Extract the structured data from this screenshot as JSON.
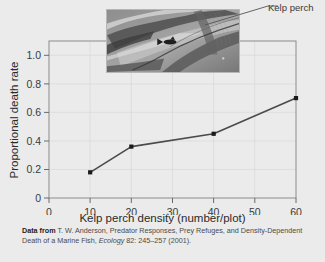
{
  "figure": {
    "top_clipped_text": "",
    "background_color": "#ebebeb"
  },
  "photo": {
    "name": "kelp-photo",
    "description": "Underwater grayscale photograph of kelp blades with a kelp perch fish"
  },
  "callout": {
    "label": "Kelp perch"
  },
  "source": {
    "lead": "Data from",
    "line1": " T. W. Anderson, Predator Responses, Prey Refuges, and Density-Dependent",
    "line2_a": "Death  of a Marine Fish, ",
    "journal": "Ecology",
    "line2_b": " 82: 245–257 (2001)."
  },
  "chart_data": {
    "type": "line",
    "title": "",
    "xlabel": "Kelp perch density (number/plot)",
    "ylabel": "Proportional death rate",
    "x": [
      10,
      20,
      40,
      60
    ],
    "values": [
      0.18,
      0.36,
      0.45,
      0.7
    ],
    "series": [
      {
        "name": "Proportional death rate",
        "values": [
          0.18,
          0.36,
          0.45,
          0.7
        ]
      }
    ],
    "xlim": [
      0,
      60
    ],
    "ylim": [
      0,
      1.1
    ],
    "xticks": [
      0,
      10,
      20,
      30,
      40,
      50,
      60
    ],
    "xticklabels": [
      "0",
      "10",
      "20",
      "30",
      "40",
      "50",
      "60"
    ],
    "yticks": [
      0,
      0.2,
      0.4,
      0.6,
      0.8,
      1.0
    ],
    "yticklabels": [
      "0",
      "0.2",
      "0.4",
      "0.6",
      "0.8",
      "1.0"
    ],
    "grid": true,
    "legend": "none",
    "line_color": "#4a4a4a",
    "marker_color": "#1a1a1a",
    "marker": "square"
  }
}
